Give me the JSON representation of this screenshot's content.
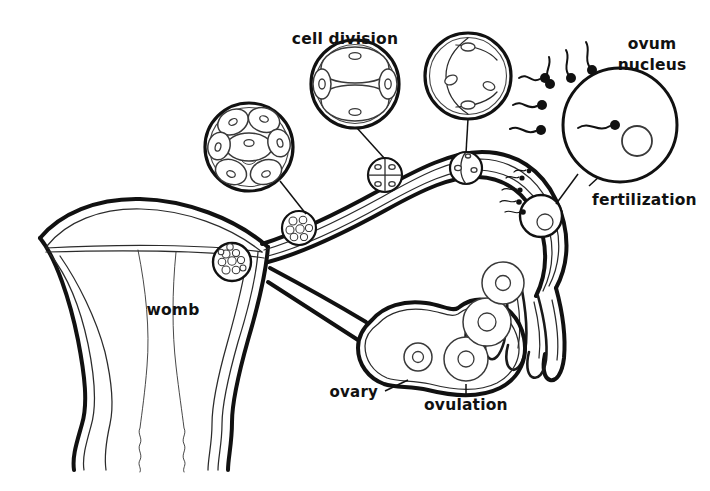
{
  "figure": {
    "style": "black-and-white line drawing",
    "background_color": "#ffffff",
    "line_color": "#111111"
  },
  "labels": {
    "cell_division": "cell division",
    "ovum_nucleus_line1": "ovum",
    "ovum_nucleus_line2": "nucleus",
    "fertilization": "fertilization",
    "womb": "womb",
    "ovary": "ovary",
    "ovulation": "ovulation"
  },
  "insets": [
    {
      "id": "morula",
      "name": "morula-inset",
      "cells": 8,
      "center": [
        249,
        147
      ],
      "radius": 44,
      "description": "multi-cell morula stage"
    },
    {
      "id": "four-cell",
      "name": "four-cell-inset",
      "cells": 4,
      "center": [
        355,
        84
      ],
      "radius": 44,
      "description": "four cell cleavage stage"
    },
    {
      "id": "two-cell",
      "name": "two-cell-inset",
      "cells": 2,
      "center": [
        468,
        76
      ],
      "radius": 43,
      "description": "two cell cleavage stage"
    },
    {
      "id": "fertilization",
      "name": "fertilization-inset",
      "cells": 1,
      "center": [
        620,
        125
      ],
      "radius": 57,
      "sperm_outside": 6,
      "sperm_inside": 1,
      "description": "ovum surrounded by sperm with one penetrating"
    }
  ],
  "tract_stages": [
    {
      "name": "implanting-blastocyst",
      "center": [
        232,
        262
      ],
      "radius": 19
    },
    {
      "name": "morula-in-tube",
      "center": [
        299,
        228
      ],
      "radius": 17
    },
    {
      "name": "four-cell-in-tube",
      "center": [
        385,
        175
      ],
      "radius": 17
    },
    {
      "name": "two-cell-in-tube",
      "center": [
        466,
        168
      ],
      "radius": 16
    },
    {
      "name": "fertilized-ovum-in-tube",
      "center": [
        541,
        216
      ],
      "radius": 21
    }
  ],
  "ovary": {
    "follicles": [
      {
        "name": "follicle-small",
        "center": [
          418,
          357
        ],
        "radius": 14
      },
      {
        "name": "follicle-ovulating",
        "center": [
          466,
          359
        ],
        "radius": 22
      },
      {
        "name": "follicle-released",
        "center": [
          487,
          322
        ],
        "radius": 24
      },
      {
        "name": "follicle-escaping",
        "center": [
          503,
          283
        ],
        "radius": 21
      }
    ]
  }
}
